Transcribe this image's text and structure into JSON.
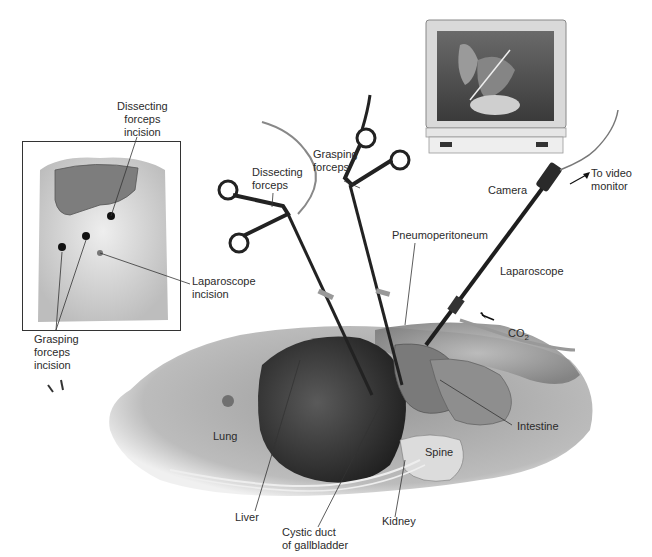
{
  "figure": {
    "inset": {
      "labels": {
        "dissecting_incision": "Dissecting\nforceps\nincision",
        "laparoscope_incision": "Laparoscope\nincision",
        "grasping_incision": "Grasping\nforceps\nincision"
      }
    },
    "instruments": {
      "dissecting_forceps": "Dissecting\nforceps",
      "grasping_forceps": "Grasping\nforceps",
      "camera": "Camera",
      "to_video_monitor": "To video\nmonitor",
      "laparoscope": "Laparoscope",
      "co2": "CO",
      "co2_sub": "2",
      "pneumoperitoneum": "Pneumoperitoneum"
    },
    "anatomy": {
      "lung": "Lung",
      "liver": "Liver",
      "cystic_duct": "Cystic duct\nof gallbladder",
      "kidney": "Kidney",
      "spine": "Spine",
      "intestine": "Intestine"
    }
  },
  "colors": {
    "line": "#333333",
    "organ_dark": "#3a3a3a",
    "organ_mid": "#8a8a8a",
    "skin": "#d6d6d6",
    "monitor_frame": "#cfcfcf",
    "monitor_screen": "#5a5a5a"
  }
}
